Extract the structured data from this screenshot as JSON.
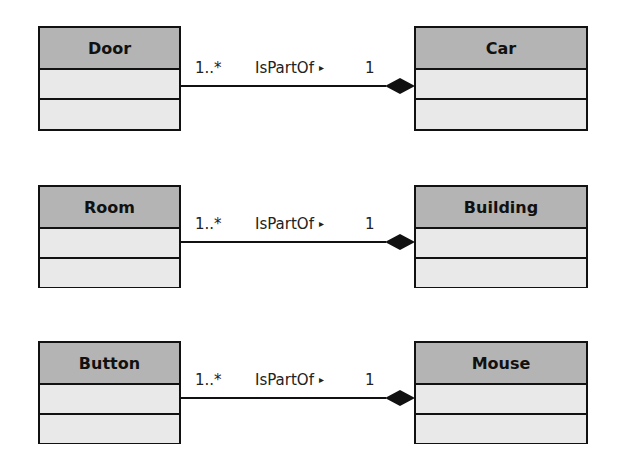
{
  "diagram": {
    "type": "UML class diagram - composition",
    "colors": {
      "header_fill": "#b4b4b4",
      "compartment_fill": "#e9e9e9",
      "stroke": "#111111"
    },
    "relations": [
      {
        "part": "Door",
        "whole": "Car",
        "part_multiplicity": "1..*",
        "label": "IsPartOf",
        "direction_arrow": "▸",
        "whole_multiplicity": "1",
        "end": "filled-diamond"
      },
      {
        "part": "Room",
        "whole": "Building",
        "part_multiplicity": "1..*",
        "label": "IsPartOf",
        "direction_arrow": "▸",
        "whole_multiplicity": "1",
        "end": "filled-diamond"
      },
      {
        "part": "Button",
        "whole": "Mouse",
        "part_multiplicity": "1..*",
        "label": "IsPartOf",
        "direction_arrow": "▸",
        "whole_multiplicity": "1",
        "end": "filled-diamond"
      }
    ]
  }
}
